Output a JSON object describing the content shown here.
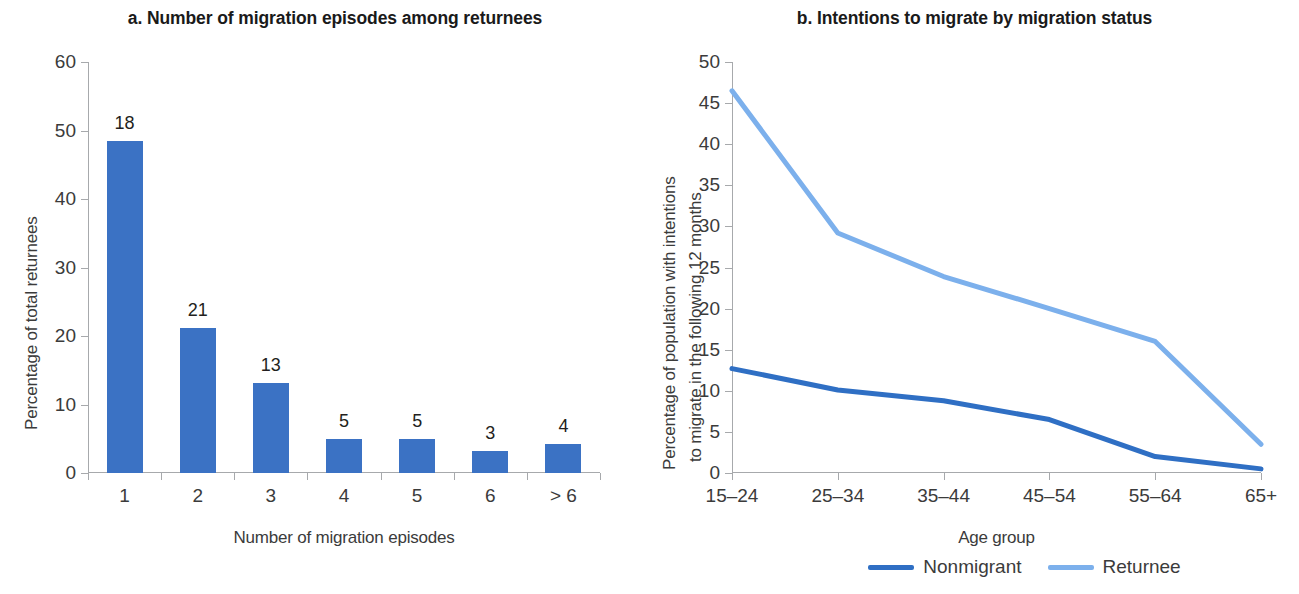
{
  "chart_data": [
    {
      "type": "bar",
      "panel": "a",
      "title": "a. Number of migration episodes among returnees",
      "xlabel": "Number of migration episodes",
      "ylabel": "Percentage of total returnees",
      "categories": [
        "1",
        "2",
        "3",
        "4",
        "5",
        "6",
        "> 6"
      ],
      "values": [
        48.5,
        21.2,
        13.2,
        4.9,
        4.9,
        3.2,
        4.2
      ],
      "data_labels": [
        "18",
        "21",
        "13",
        "5",
        "5",
        "3",
        "4"
      ],
      "ylim": [
        0,
        60
      ],
      "yticks": [
        "0",
        "10",
        "20",
        "30",
        "40",
        "50",
        "60"
      ],
      "grid": false,
      "legend": "none",
      "bar_color": "#3b72c4"
    },
    {
      "type": "line",
      "panel": "b",
      "title": "b. Intentions to migrate by migration status",
      "xlabel": "Age group",
      "ylabel_line1": "Percentage of population with intentions",
      "ylabel_line2": "to migrate in the following 12 months",
      "categories": [
        "15–24",
        "25–34",
        "35–44",
        "45–54",
        "55–64",
        "65+"
      ],
      "series": [
        {
          "name": "Nonmigrant",
          "color": "#2f6fc4",
          "values": [
            12.7,
            10.1,
            8.8,
            6.5,
            2.0,
            0.5
          ]
        },
        {
          "name": "Returnee",
          "color": "#7cb0ec",
          "values": [
            46.5,
            29.2,
            23.9,
            20.0,
            16.0,
            3.5
          ]
        }
      ],
      "ylim": [
        0,
        50
      ],
      "yticks": [
        "0",
        "5",
        "10",
        "15",
        "20",
        "25",
        "30",
        "35",
        "40",
        "45",
        "50"
      ],
      "grid": false,
      "legend": "bottom-center"
    }
  ],
  "panel_a": {
    "title": "a. Number of migration episodes among returnees",
    "ylabel": "Percentage of total returnees",
    "xlabel": "Number of migration episodes",
    "yticks": [
      "0",
      "10",
      "20",
      "30",
      "40",
      "50",
      "60"
    ],
    "xticks": [
      "1",
      "2",
      "3",
      "4",
      "5",
      "6",
      "> 6"
    ],
    "bar_labels": [
      "18",
      "21",
      "13",
      "5",
      "5",
      "3",
      "4"
    ]
  },
  "panel_b": {
    "title": "b. Intentions to migrate by migration status",
    "ylabel_line1": "Percentage of population with intentions",
    "ylabel_line2": "to migrate in the following 12 months",
    "xlabel": "Age group",
    "yticks": [
      "0",
      "5",
      "10",
      "15",
      "20",
      "25",
      "30",
      "35",
      "40",
      "45",
      "50"
    ],
    "xticks": [
      "15–24",
      "25–34",
      "35–44",
      "45–54",
      "55–64",
      "65+"
    ],
    "legend": [
      {
        "label": "Nonmigrant",
        "color": "#2f6fc4"
      },
      {
        "label": "Returnee",
        "color": "#7cb0ec"
      }
    ]
  }
}
